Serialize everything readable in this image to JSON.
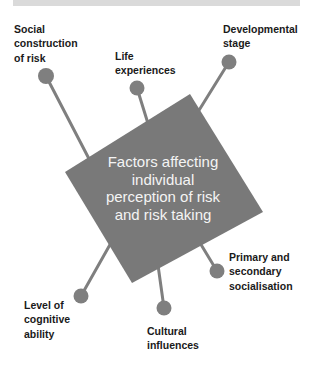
{
  "diagram": {
    "center": {
      "lines": [
        "Factors affecting",
        "individual",
        "perception of risk",
        "and risk taking"
      ]
    },
    "factors": [
      {
        "id": "social-construction",
        "lines": [
          "Social",
          "construction",
          "of risk"
        ]
      },
      {
        "id": "life-experiences",
        "lines": [
          "Life",
          "experiences"
        ]
      },
      {
        "id": "developmental-stage",
        "lines": [
          "Developmental",
          "stage"
        ]
      },
      {
        "id": "socialisation",
        "lines": [
          "Primary and",
          "secondary",
          "socialisation"
        ]
      },
      {
        "id": "cultural-influences",
        "lines": [
          "Cultural",
          "influences"
        ]
      },
      {
        "id": "cognitive-ability",
        "lines": [
          "Level of",
          "cognitive",
          "ability"
        ]
      }
    ]
  },
  "colors": {
    "hub_fill": "#797979",
    "connector": "#7f7f7f",
    "center_text": "#f4f4f4",
    "label_text": "#1a1a1a",
    "top_bar": "#dadada"
  }
}
